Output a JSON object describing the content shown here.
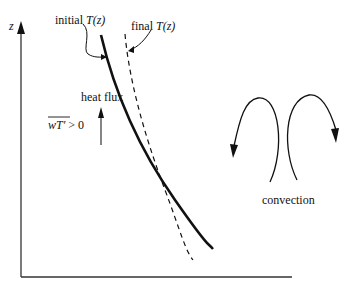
{
  "axes": {
    "y_label": "z",
    "x_label": ""
  },
  "labels": {
    "initial_prefix": "initial ",
    "initial_func": "T(z)",
    "final_prefix": "final ",
    "final_func": "T(z)",
    "heat_flux": "heat flux",
    "flux_condition_lhs": "wT′",
    "flux_condition_rhs": " > 0",
    "convection": "convection"
  },
  "curves": [
    {
      "name": "initial T(z)",
      "style": "solid"
    },
    {
      "name": "final T(z)",
      "style": "dashed"
    }
  ],
  "colors": {
    "line": "#111111",
    "background": "#ffffff"
  }
}
